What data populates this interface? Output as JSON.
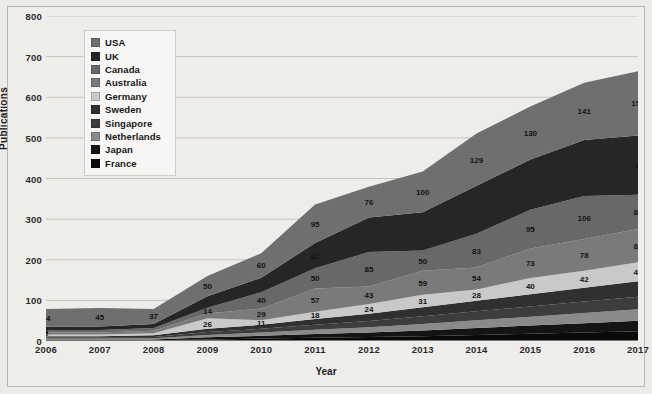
{
  "chart_data": {
    "type": "area",
    "stacked": true,
    "title": "",
    "xlabel": "Year",
    "ylabel": "Publications",
    "categories": [
      "2006",
      "2007",
      "2008",
      "2009",
      "2010",
      "2011",
      "2012",
      "2013",
      "2014",
      "2015",
      "2016",
      "2017"
    ],
    "ylim": [
      0,
      800
    ],
    "ytick_labels": [
      "0",
      "100",
      "200",
      "300",
      "400",
      "500",
      "600",
      "700",
      "800"
    ],
    "ytick_values": [
      0,
      100,
      200,
      300,
      400,
      500,
      600,
      700,
      800
    ],
    "grid": true,
    "legend_position": "upper-left-inside",
    "series": [
      {
        "name": "USA",
        "color": "#6f6f6f",
        "values": [
          44,
          45,
          37,
          50,
          60,
          95,
          76,
          100,
          129,
          130,
          141,
          158
        ]
      },
      {
        "name": "UK",
        "color": "#262626",
        "values": [
          8,
          9,
          10,
          28,
          36,
          62,
          85,
          94,
          118,
          124,
          138,
          146
        ]
      },
      {
        "name": "Canada",
        "color": "#686868",
        "values": [
          6,
          6,
          7,
          14,
          40,
          50,
          85,
          50,
          83,
          95,
          106,
          84
        ]
      },
      {
        "name": "Australia",
        "color": "#7a7a7a",
        "values": [
          5,
          5,
          6,
          12,
          29,
          57,
          43,
          59,
          54,
          73,
          78,
          82
        ]
      },
      {
        "name": "Germany",
        "color": "#c9c9c9",
        "values": [
          4,
          4,
          5,
          26,
          11,
          18,
          24,
          31,
          28,
          40,
          42,
          47
        ]
      },
      {
        "name": "Sweden",
        "color": "#303030",
        "values": [
          3,
          3,
          4,
          8,
          10,
          14,
          18,
          22,
          26,
          30,
          34,
          38
        ]
      },
      {
        "name": "Singapore",
        "color": "#3d3d3d",
        "values": [
          3,
          3,
          3,
          7,
          9,
          12,
          15,
          19,
          22,
          25,
          28,
          31
        ]
      },
      {
        "name": "Netherlands",
        "color": "#8a8a8a",
        "values": [
          2,
          2,
          3,
          6,
          8,
          11,
          13,
          16,
          19,
          22,
          25,
          28
        ]
      },
      {
        "name": "Japan",
        "color": "#141414",
        "values": [
          2,
          2,
          2,
          5,
          7,
          9,
          11,
          14,
          17,
          20,
          23,
          26
        ]
      },
      {
        "name": "France",
        "color": "#0a0a0a",
        "values": [
          2,
          2,
          2,
          4,
          6,
          8,
          10,
          12,
          15,
          18,
          21,
          24
        ]
      }
    ],
    "data_labels": [
      {
        "year": "2006",
        "series": "USA",
        "value": "44"
      },
      {
        "year": "2006",
        "series": "Canada",
        "value": "6"
      },
      {
        "year": "2006",
        "series": "Australia",
        "value": "5"
      },
      {
        "year": "2007",
        "series": "USA",
        "value": "45"
      },
      {
        "year": "2008",
        "series": "USA",
        "value": "37"
      },
      {
        "year": "2009",
        "series": "USA",
        "value": "50"
      },
      {
        "year": "2009",
        "series": "Canada",
        "value": "14"
      },
      {
        "year": "2009",
        "series": "Germany",
        "value": "26"
      },
      {
        "year": "2010",
        "series": "USA",
        "value": "60"
      },
      {
        "year": "2010",
        "series": "Canada",
        "value": "40"
      },
      {
        "year": "2010",
        "series": "Australia",
        "value": "29"
      },
      {
        "year": "2010",
        "series": "Germany",
        "value": "11"
      },
      {
        "year": "2011",
        "series": "USA",
        "value": "95"
      },
      {
        "year": "2011",
        "series": "UK",
        "value": "62"
      },
      {
        "year": "2011",
        "series": "Canada",
        "value": "50"
      },
      {
        "year": "2011",
        "series": "Australia",
        "value": "57"
      },
      {
        "year": "2011",
        "series": "Germany",
        "value": "18"
      },
      {
        "year": "2012",
        "series": "USA",
        "value": "76"
      },
      {
        "year": "2012",
        "series": "Canada",
        "value": "85"
      },
      {
        "year": "2012",
        "series": "Australia",
        "value": "43"
      },
      {
        "year": "2012",
        "series": "Germany",
        "value": "24"
      },
      {
        "year": "2013",
        "series": "USA",
        "value": "100"
      },
      {
        "year": "2013",
        "series": "Canada",
        "value": "50"
      },
      {
        "year": "2013",
        "series": "Australia",
        "value": "59"
      },
      {
        "year": "2013",
        "series": "Germany",
        "value": "31"
      },
      {
        "year": "2014",
        "series": "USA",
        "value": "129"
      },
      {
        "year": "2014",
        "series": "Canada",
        "value": "83"
      },
      {
        "year": "2014",
        "series": "Australia",
        "value": "54"
      },
      {
        "year": "2014",
        "series": "Germany",
        "value": "28"
      },
      {
        "year": "2015",
        "series": "USA",
        "value": "130"
      },
      {
        "year": "2015",
        "series": "Canada",
        "value": "95"
      },
      {
        "year": "2015",
        "series": "Australia",
        "value": "73"
      },
      {
        "year": "2015",
        "series": "Germany",
        "value": "40"
      },
      {
        "year": "2016",
        "series": "USA",
        "value": "141"
      },
      {
        "year": "2016",
        "series": "Canada",
        "value": "106"
      },
      {
        "year": "2016",
        "series": "Australia",
        "value": "78"
      },
      {
        "year": "2016",
        "series": "Germany",
        "value": "42"
      },
      {
        "year": "2017",
        "series": "USA",
        "value": "158"
      },
      {
        "year": "2017",
        "series": "UK",
        "value": "6"
      },
      {
        "year": "2017",
        "series": "Canada",
        "value": "84"
      },
      {
        "year": "2017",
        "series": "Australia",
        "value": "82"
      },
      {
        "year": "2017",
        "series": "Germany",
        "value": "47"
      }
    ]
  },
  "legend": {
    "items": [
      {
        "label": "USA"
      },
      {
        "label": "UK"
      },
      {
        "label": "Canada"
      },
      {
        "label": "Australia"
      },
      {
        "label": "Germany"
      },
      {
        "label": "Sweden"
      },
      {
        "label": "Singapore"
      },
      {
        "label": "Netherlands"
      },
      {
        "label": "Japan"
      },
      {
        "label": "France"
      }
    ]
  },
  "axes": {
    "y_title": "Publications",
    "x_title": "Year"
  }
}
